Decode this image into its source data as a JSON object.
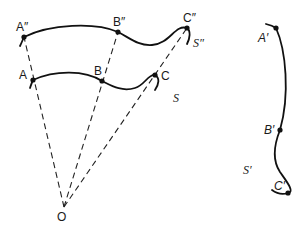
{
  "diagram": {
    "colors": {
      "ink": "#111111",
      "background": "#ffffff"
    },
    "vertex": {
      "label": "O"
    },
    "curves": [
      {
        "id": "s_double_prime",
        "label": "S″",
        "points": [
          "A″",
          "B″",
          "C″"
        ]
      },
      {
        "id": "s",
        "label": "S",
        "points": [
          "A",
          "B",
          "C"
        ]
      },
      {
        "id": "s_prime",
        "label": "S′",
        "points": [
          "A′",
          "B′",
          "C′"
        ]
      }
    ],
    "labels": {
      "A2": "A″",
      "B2": "B″",
      "C2": "C″",
      "A": "A",
      "B": "B",
      "C": "C",
      "A1": "A′",
      "B1": "B′",
      "C1": "C′",
      "S": "S",
      "S2": "S″",
      "S1": "S′",
      "O": "O"
    },
    "projection_rays": [
      "O→A→A″",
      "O→B→B″",
      "O→C→C″"
    ]
  }
}
